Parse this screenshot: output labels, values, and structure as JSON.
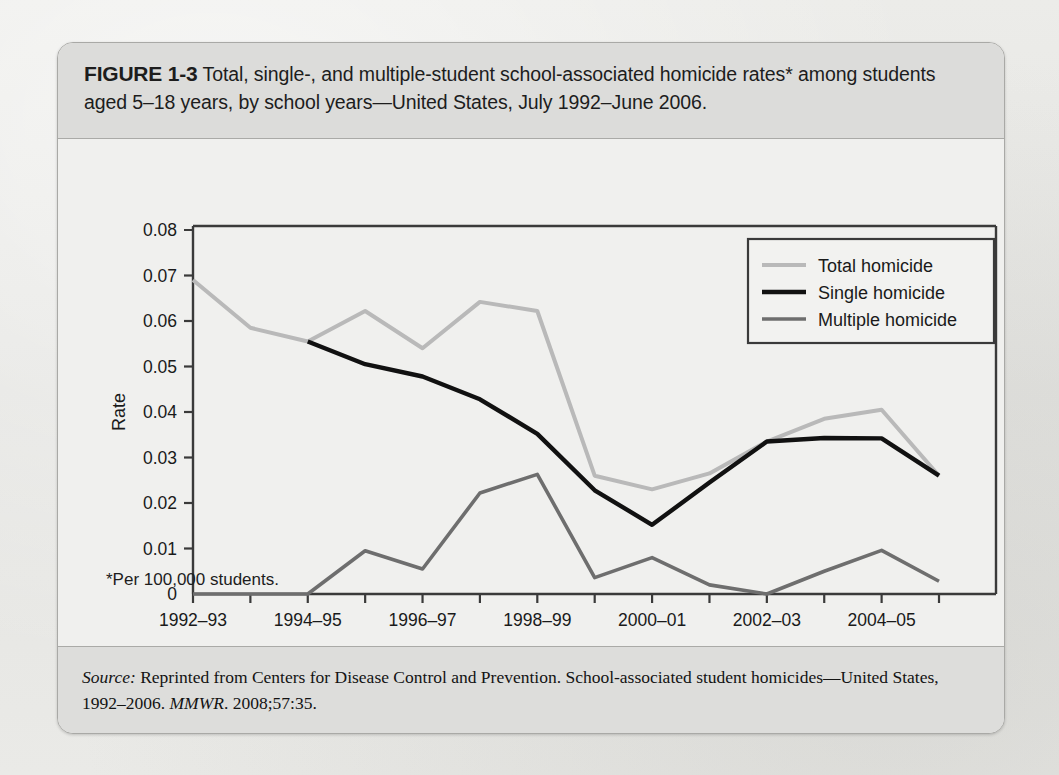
{
  "figure": {
    "label": "FIGURE 1-3",
    "caption": " Total, single-, and multiple-student school-associated homicide rates* among students aged 5–18 years, by school years—United States, July 1992–June 2006.",
    "footnote": "*Per 100,000 students.",
    "source_prefix": "Source:",
    "source_body_1": " Reprinted from Centers for Disease Control and Prevention. School-associated student homicides—United States, 1992–2006. ",
    "source_journal": "MMWR",
    "source_body_2": ". 2008;57:35."
  },
  "colors": {
    "page_background": "#e8e8e6",
    "panel_background": "#f3f3f1",
    "header_band": "#dcdcda",
    "source_band": "#dddddb",
    "border": "#a9a9a6",
    "axis": "#3a3a3a",
    "total_homicide": "#b9b9b9",
    "single_homicide": "#111111",
    "multiple_homicide": "#6e6e6e"
  },
  "chart_data": {
    "type": "line",
    "xlabel": "School year",
    "ylabel": "Rate",
    "ylim": [
      0,
      0.08
    ],
    "ytick_values": [
      0,
      0.01,
      0.02,
      0.03,
      0.04,
      0.05,
      0.06,
      0.07,
      0.08
    ],
    "ytick_labels": [
      "0",
      "0.01",
      "0.02",
      "0.03",
      "0.04",
      "0.05",
      "0.06",
      "0.07",
      "0.08"
    ],
    "grid": false,
    "legend_position": "top-right",
    "categories": [
      "1992–93",
      "1993–94",
      "1994–95",
      "1995–96",
      "1996–97",
      "1997–98",
      "1998–99",
      "1999–2000",
      "2000–01",
      "2001–02",
      "2002–03",
      "2003–04",
      "2004–05",
      "2005–06"
    ],
    "xtick_labels": [
      "1992–93",
      "",
      "1994–95",
      "",
      "1996–97",
      "",
      "1998–99",
      "",
      "2000–01",
      "",
      "2002–03",
      "",
      "2004–05",
      ""
    ],
    "series": [
      {
        "name": "Total homicide",
        "color": "#b9b9b9",
        "width": 4,
        "values": [
          0.069,
          0.0585,
          0.0555,
          0.0622,
          0.054,
          0.0642,
          0.0622,
          0.026,
          0.023,
          0.0265,
          0.0335,
          0.0385,
          0.0405,
          0.026
        ]
      },
      {
        "name": "Single homicide",
        "color": "#111111",
        "width": 4.4,
        "values": [
          null,
          null,
          0.0555,
          0.0505,
          0.0478,
          0.0428,
          0.0352,
          0.0228,
          0.0152,
          0.0245,
          0.0335,
          0.0343,
          0.0342,
          0.026
        ]
      },
      {
        "name": "Multiple homicide",
        "color": "#6e6e6e",
        "width": 3.6,
        "values": [
          0,
          0,
          0,
          0.0095,
          0.0055,
          0.0222,
          0.0263,
          0.0036,
          0.008,
          0.002,
          0.0,
          0.005,
          0.0096,
          0.0028
        ]
      }
    ]
  },
  "legend": {
    "items": [
      {
        "label": "Total homicide"
      },
      {
        "label": "Single homicide"
      },
      {
        "label": "Multiple homicide"
      }
    ]
  }
}
